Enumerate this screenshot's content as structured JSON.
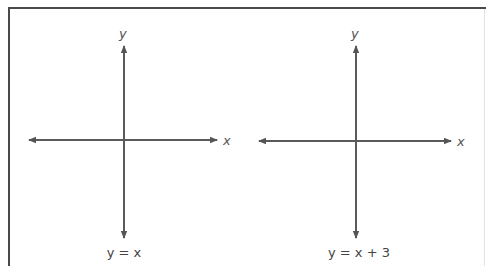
{
  "graphs": [
    {
      "x_axis_label": "x",
      "y_axis_label": "y",
      "equation": "y = x"
    },
    {
      "x_axis_label": "x",
      "y_axis_label": "y",
      "equation": "y = x + 3"
    }
  ],
  "colors": {
    "axis": "#555555",
    "border": "#4a4a4a"
  }
}
